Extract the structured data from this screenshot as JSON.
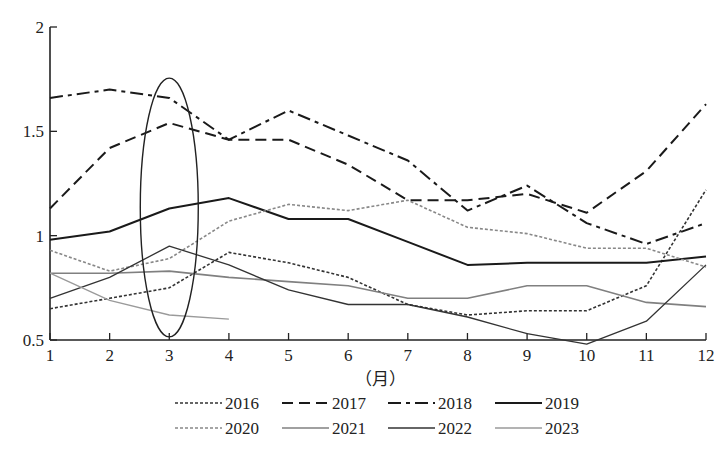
{
  "chart_data": {
    "type": "line",
    "title": "",
    "xlabel": "（月）",
    "ylabel": "",
    "x": [
      1,
      2,
      3,
      4,
      5,
      6,
      7,
      8,
      9,
      10,
      11,
      12
    ],
    "x_tick_labels": [
      "1",
      "2",
      "3",
      "4",
      "5",
      "6",
      "7",
      "8",
      "9",
      "10",
      "11",
      "12"
    ],
    "y_ticks": [
      0.5,
      1,
      1.5,
      2
    ],
    "y_tick_labels": [
      "0.5",
      "1",
      "1.5",
      "2"
    ],
    "ylim": [
      0.5,
      2
    ],
    "xlim": [
      1,
      12
    ],
    "grid": false,
    "legend_position": "bottom",
    "annotations": [
      {
        "type": "ellipse",
        "description": "Ellipse highlighting month 3",
        "cx": 3,
        "cy": 1.135,
        "ry": 0.62
      }
    ],
    "series": [
      {
        "name": "2016",
        "style": "dotted",
        "color": "#333333",
        "width": 1.6,
        "values": [
          0.65,
          0.7,
          0.75,
          0.92,
          0.87,
          0.8,
          0.67,
          0.62,
          0.64,
          0.64,
          0.76,
          1.22
        ]
      },
      {
        "name": "2017",
        "style": "dashed",
        "color": "#1a1a1a",
        "width": 2.0,
        "values": [
          1.13,
          1.42,
          1.54,
          1.46,
          1.46,
          1.34,
          1.17,
          1.17,
          1.2,
          1.11,
          1.31,
          1.63
        ]
      },
      {
        "name": "2018",
        "style": "dashdot",
        "color": "#1a1a1a",
        "width": 2.0,
        "values": [
          1.66,
          1.7,
          1.66,
          1.46,
          1.6,
          1.48,
          1.36,
          1.12,
          1.24,
          1.06,
          0.96,
          1.06
        ]
      },
      {
        "name": "2019",
        "style": "solid",
        "color": "#1a1a1a",
        "width": 2.0,
        "values": [
          0.98,
          1.02,
          1.13,
          1.18,
          1.08,
          1.08,
          0.97,
          0.86,
          0.87,
          0.87,
          0.87,
          0.9
        ]
      },
      {
        "name": "2020",
        "style": "dotted",
        "color": "#888888",
        "width": 1.6,
        "values": [
          0.93,
          0.83,
          0.89,
          1.07,
          1.15,
          1.12,
          1.17,
          1.04,
          1.01,
          0.94,
          0.94,
          0.85
        ]
      },
      {
        "name": "2021",
        "style": "solid",
        "color": "#808080",
        "width": 1.6,
        "values": [
          0.82,
          0.82,
          0.83,
          0.8,
          0.78,
          0.76,
          0.7,
          0.7,
          0.76,
          0.76,
          0.68,
          0.66
        ]
      },
      {
        "name": "2022",
        "style": "solid",
        "color": "#333333",
        "width": 1.3,
        "values": [
          0.7,
          0.8,
          0.95,
          0.86,
          0.74,
          0.67,
          0.67,
          0.61,
          0.53,
          0.48,
          0.59,
          0.86
        ]
      },
      {
        "name": "2023",
        "style": "solid",
        "color": "#9a9a9a",
        "width": 1.3,
        "values": [
          0.82,
          0.69,
          0.62,
          0.6,
          null,
          null,
          null,
          null,
          null,
          null,
          null,
          null
        ]
      }
    ]
  },
  "legend": {
    "items": [
      {
        "label": "2016"
      },
      {
        "label": "2017"
      },
      {
        "label": "2018"
      },
      {
        "label": "2019"
      },
      {
        "label": "2020"
      },
      {
        "label": "2021"
      },
      {
        "label": "2022"
      },
      {
        "label": "2023"
      }
    ]
  },
  "axes": {
    "x_title": "（月）"
  }
}
